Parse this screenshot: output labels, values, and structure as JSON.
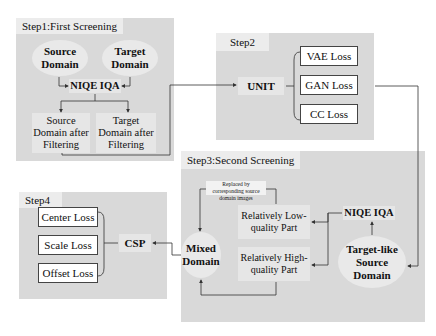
{
  "step1": {
    "title": "Step1:First Screening",
    "source": "Source Domain",
    "target": "Target Domain",
    "niqe": "NIQE IQA",
    "source_filtered": "Source Domain after Filtering",
    "target_filtered": "Target Domain after Filtering"
  },
  "step2": {
    "title": "Step2",
    "unit": "UNIT",
    "losses": [
      "VAE Loss",
      "GAN Loss",
      "CC Loss"
    ]
  },
  "step3": {
    "title": "Step3:Second Screening",
    "note": "Replaced by corresponding source domain images",
    "low": "Relatively Low-quality Part",
    "high": "Relatively High-quality Part",
    "niqe": "NIQE IQA",
    "target_like": "Target-like Source Domain",
    "mixed": "Mixed Domain"
  },
  "step4": {
    "title": "Step4",
    "csp": "CSP",
    "losses": [
      "Center Loss",
      "Scale Loss",
      "Offset Loss"
    ]
  }
}
